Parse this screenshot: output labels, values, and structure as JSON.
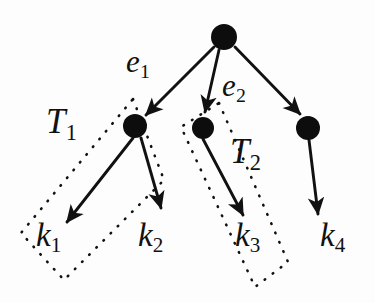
{
  "figure": {
    "type": "diagram",
    "name": "binary-tree-with-subtree-groupings",
    "background_color": "#fdfdfd",
    "stroke_color": "#111111",
    "node_fill_color": "#0d0d0d",
    "width": 375,
    "height": 303
  },
  "nodes": [
    {
      "id": "root",
      "name": "root-node",
      "cx": 224,
      "cy": 37,
      "r": 13
    },
    {
      "id": "n1",
      "name": "left-child-node",
      "cx": 135,
      "cy": 126,
      "r": 12
    },
    {
      "id": "n2",
      "name": "middle-child-node",
      "cx": 203,
      "cy": 128,
      "r": 11
    },
    {
      "id": "n3",
      "name": "right-child-node",
      "cx": 308,
      "cy": 128,
      "r": 12
    }
  ],
  "edges": [
    {
      "id": "e1",
      "name": "edge-root-to-left",
      "from": "root",
      "to": "n1",
      "label": "e",
      "sub": "1"
    },
    {
      "id": "e2",
      "name": "edge-root-to-middle",
      "from": "root",
      "to": "n2",
      "label": "e",
      "sub": "2"
    },
    {
      "id": "e3",
      "name": "edge-root-to-right",
      "from": "root",
      "to": "n3",
      "label": "",
      "sub": ""
    },
    {
      "id": "l1",
      "name": "edge-left-to-k1",
      "from": "n1",
      "to": "k1",
      "label": "",
      "sub": ""
    },
    {
      "id": "l2",
      "name": "edge-left-to-k2",
      "from": "n1",
      "to": "k2",
      "label": "",
      "sub": ""
    },
    {
      "id": "l3",
      "name": "edge-middle-to-k3",
      "from": "n2",
      "to": "k3",
      "label": "",
      "sub": ""
    },
    {
      "id": "l4",
      "name": "edge-right-to-k4",
      "from": "n3",
      "to": "k4",
      "label": "",
      "sub": ""
    }
  ],
  "edge_labels": [
    {
      "name": "edge-label-e1",
      "base": "e",
      "sub": "1",
      "x": 126,
      "y": 46
    },
    {
      "name": "edge-label-e2",
      "base": "e",
      "sub": "2",
      "x": 222,
      "y": 70
    }
  ],
  "leaf_labels": [
    {
      "name": "leaf-label-k1",
      "base": "k",
      "sub": "1",
      "x": 36,
      "y": 219
    },
    {
      "name": "leaf-label-k2",
      "base": "k",
      "sub": "2",
      "x": 138,
      "y": 219
    },
    {
      "name": "leaf-label-k3",
      "base": "k",
      "sub": "3",
      "x": 235,
      "y": 219
    },
    {
      "name": "leaf-label-k4",
      "base": "k",
      "sub": "4",
      "x": 320,
      "y": 219
    }
  ],
  "group_labels": [
    {
      "name": "group-label-T1",
      "base": "T",
      "sub": "1",
      "x": 46,
      "y": 104
    },
    {
      "name": "group-label-T2",
      "base": "T",
      "sub": "2",
      "x": 230,
      "y": 134
    }
  ],
  "group_boxes": [
    {
      "id": "T1",
      "name": "dotted-group-box-T1",
      "points": "133,99 164,180 64,280 21,233",
      "style": "dotted"
    },
    {
      "id": "T2",
      "name": "dotted-group-box-T2",
      "points": "219,103 288,262 255,287 181,127",
      "style": "dotted"
    }
  ],
  "arrow_tips": [
    {
      "name": "arrowhead-to-left-child"
    },
    {
      "name": "arrowhead-to-middle-child"
    },
    {
      "name": "arrowhead-to-right-child"
    },
    {
      "name": "arrowhead-to-k1"
    },
    {
      "name": "arrowhead-to-k2"
    },
    {
      "name": "arrowhead-to-k3"
    },
    {
      "name": "arrowhead-to-k4"
    }
  ]
}
